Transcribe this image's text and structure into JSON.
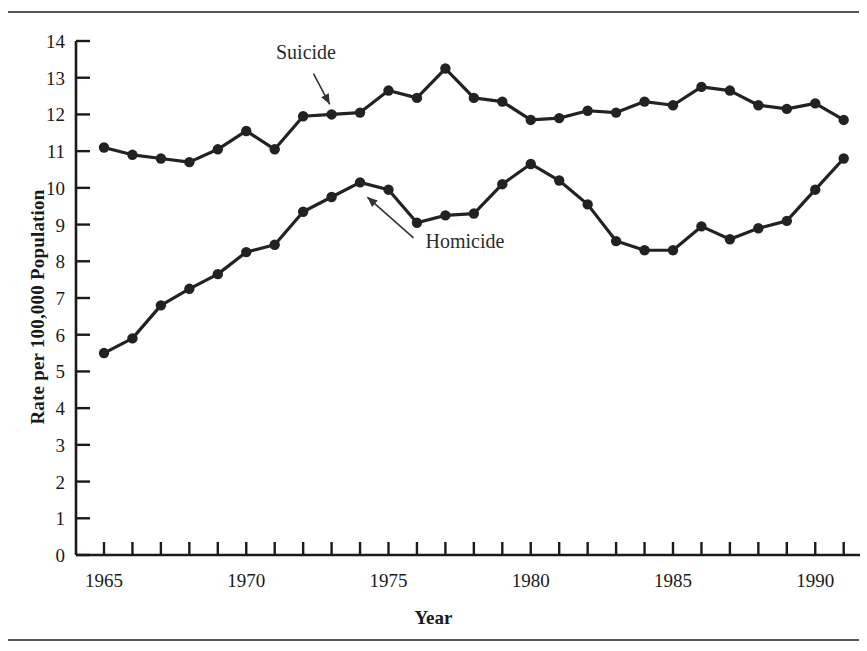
{
  "figure": {
    "xlabel": "Year",
    "ylabel": "Rate per 100,000 Population",
    "series_labels": {
      "suicide": "Suicide",
      "homicide": "Homicide"
    }
  },
  "chart_data": {
    "type": "line",
    "title": "",
    "xlabel": "Year",
    "ylabel": "Rate per 100,000 Population",
    "xlim": [
      1964.6,
      1991.4
    ],
    "ylim": [
      0,
      14
    ],
    "xticks": [
      1965,
      1966,
      1967,
      1968,
      1969,
      1970,
      1971,
      1972,
      1973,
      1974,
      1975,
      1976,
      1977,
      1978,
      1979,
      1980,
      1981,
      1982,
      1983,
      1984,
      1985,
      1986,
      1987,
      1988,
      1989,
      1990,
      1991
    ],
    "xticklabels_shown": [
      "1965",
      "1970",
      "1975",
      "1980",
      "1985",
      "1990"
    ],
    "xticklabels_shown_values": [
      1965,
      1970,
      1975,
      1980,
      1985,
      1990
    ],
    "yticks": [
      0,
      1,
      2,
      3,
      4,
      5,
      6,
      7,
      8,
      9,
      10,
      11,
      12,
      13,
      14
    ],
    "grid": false,
    "legend": "inline-annotations",
    "marker": "filled-circle",
    "line_color": "#222222",
    "x": [
      1965,
      1966,
      1967,
      1968,
      1969,
      1970,
      1971,
      1972,
      1973,
      1974,
      1975,
      1976,
      1977,
      1978,
      1979,
      1980,
      1981,
      1982,
      1983,
      1984,
      1985,
      1986,
      1987,
      1988,
      1989,
      1990,
      1991
    ],
    "series": [
      {
        "name": "Suicide",
        "values": [
          11.1,
          10.9,
          10.8,
          10.7,
          11.05,
          11.55,
          11.05,
          11.95,
          12.0,
          12.05,
          12.65,
          12.45,
          13.25,
          12.45,
          12.35,
          11.85,
          11.9,
          12.1,
          12.05,
          12.35,
          12.25,
          12.75,
          12.65,
          12.25,
          12.15,
          12.3,
          11.85
        ]
      },
      {
        "name": "Homicide",
        "values": [
          5.5,
          5.9,
          6.8,
          7.25,
          7.65,
          8.25,
          8.45,
          9.35,
          9.75,
          10.15,
          9.95,
          9.05,
          9.25,
          9.3,
          10.1,
          10.65,
          10.2,
          9.55,
          8.55,
          8.3,
          8.3,
          8.95,
          8.6,
          8.9,
          9.1,
          9.95,
          10.8
        ]
      }
    ],
    "annotations": [
      {
        "text": "Suicide",
        "x_text": 1972.1,
        "y_text": 13.5,
        "points_to_x": 1973.0,
        "points_to_y": 12.18
      },
      {
        "text": "Homicide",
        "x_text": 1976.3,
        "y_text": 8.35,
        "points_to_x": 1974.15,
        "points_to_y": 9.82
      }
    ]
  }
}
